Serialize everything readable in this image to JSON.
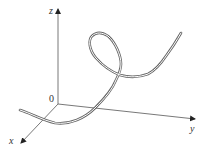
{
  "figure": {
    "type": "3d-space-curve",
    "axes": {
      "x": {
        "label": "x"
      },
      "y": {
        "label": "y"
      },
      "z": {
        "label": "z"
      },
      "origin_label": "0"
    },
    "curve": {
      "style": "ribbon",
      "description": "space curve rising from near the xy-plane, forming a loop, then continuing upward"
    },
    "colors": {
      "axis": "#555555",
      "curve": "#666666",
      "ribbon_fill": "#ffffff",
      "background": "#ffffff"
    }
  }
}
